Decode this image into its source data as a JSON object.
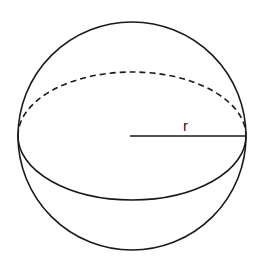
{
  "diagram": {
    "shape": "sphere",
    "labels": {
      "radius": "r"
    },
    "colors": {
      "stroke": "#1a1a1a",
      "background": "#ffffff"
    }
  }
}
